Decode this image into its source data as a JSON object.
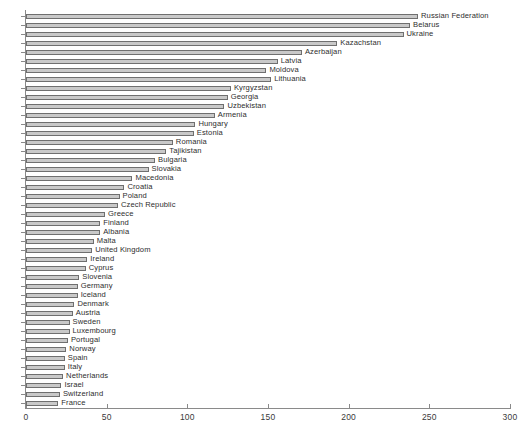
{
  "chart_data": {
    "type": "bar",
    "orientation": "horizontal",
    "title": "",
    "subtitle": "",
    "xlabel": "",
    "ylabel": "",
    "xlim": [
      0,
      300
    ],
    "xticks": [
      0,
      50,
      100,
      150,
      200,
      250,
      300
    ],
    "xtick_labels": [
      "0",
      "50",
      "100",
      "150",
      "200",
      "250",
      "300"
    ],
    "grid": false,
    "legend": false,
    "bar_color": "#c9c9c9",
    "bar_edge_color": "#6f6f6f",
    "axis_color": "#8a8a8a",
    "label_color": "#2e2e2e",
    "categories": [
      "Russian Federation",
      "Belarus",
      "Ukraine",
      "Kazachstan",
      "Azerbaijan",
      "Latvia",
      "Moldova",
      "Lithuania",
      "Kyrgyzstan",
      "Georgia",
      "Uzbekistan",
      "Armenia",
      "Hungary",
      "Estonia",
      "Romania",
      "Tajikistan",
      "Bulgaria",
      "Slovakia",
      "Macedonia",
      "Croatia",
      "Poland",
      "Czech Republic",
      "Greece",
      "Finland",
      "Albania",
      "Malta",
      "United Kingdom",
      "Ireland",
      "Cyprus",
      "Slovenia",
      "Germany",
      "Iceland",
      "Denmark",
      "Austria",
      "Sweden",
      "Luxembourg",
      "Portugal",
      "Norway",
      "Spain",
      "Italy",
      "Netherlands",
      "Israel",
      "Switzerland",
      "France"
    ],
    "values": [
      243,
      238,
      234,
      193,
      171,
      156,
      149,
      152,
      127,
      125,
      123,
      117,
      105,
      104,
      91,
      87,
      80,
      76,
      66,
      61,
      58,
      57,
      49,
      46,
      46,
      42,
      41,
      38,
      37,
      33,
      32,
      32,
      30,
      29,
      27,
      27,
      26,
      25,
      24,
      24,
      23,
      22,
      21,
      20
    ]
  }
}
